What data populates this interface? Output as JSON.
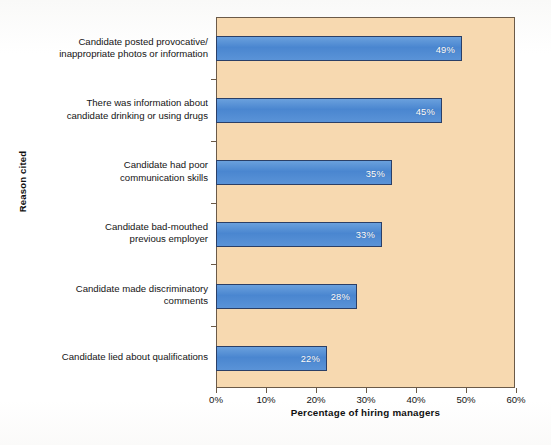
{
  "chart_data": {
    "type": "bar",
    "orientation": "horizontal",
    "title": "",
    "xlabel": "Percentage of hiring managers",
    "ylabel": "Reason cited",
    "xlim": [
      0,
      60
    ],
    "xtick_step": 10,
    "xticks": [
      "0%",
      "10%",
      "20%",
      "30%",
      "40%",
      "50%",
      "60%"
    ],
    "grid": false,
    "legend": "none",
    "plot_background_color": "#f7d9b0",
    "bar_color": "#4a86d0",
    "bar_border_color": "#2b3f66",
    "value_label_color": "#ffffff",
    "categories": [
      "Candidate posted provocative/ inappropriate photos or information",
      "There was information about candidate drinking or using drugs",
      "Candidate had poor communication skills",
      "Candidate bad-mouthed previous employer",
      "Candidate made discriminatory comments",
      "Candidate lied about qualifications"
    ],
    "category_lines": [
      [
        "Candidate posted provocative/",
        "inappropriate photos or information"
      ],
      [
        "There was information about",
        "candidate drinking or using drugs"
      ],
      [
        "Candidate had poor",
        "communication skills"
      ],
      [
        "Candidate bad-mouthed",
        "previous employer"
      ],
      [
        "Candidate made discriminatory",
        "comments"
      ],
      [
        "Candidate lied about qualifications"
      ]
    ],
    "values": [
      49,
      45,
      35,
      33,
      28,
      22
    ],
    "value_labels": [
      "49%",
      "45%",
      "35%",
      "33%",
      "28%",
      "22%"
    ]
  }
}
